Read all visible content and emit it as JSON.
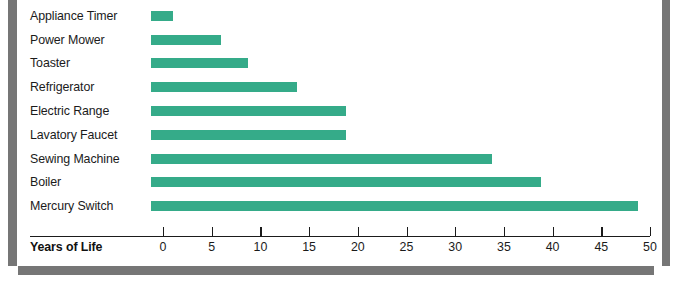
{
  "chart_data": {
    "type": "bar",
    "orientation": "horizontal",
    "title": "",
    "xlabel": "Years of Life",
    "ylabel": "",
    "xlim": [
      0,
      50
    ],
    "grid": false,
    "legend": null,
    "bar_color": "#35ab89",
    "xticks": [
      0,
      5,
      10,
      15,
      20,
      25,
      30,
      35,
      40,
      45,
      50
    ],
    "xtick_labels": [
      "0",
      "5",
      "10",
      "15",
      "20",
      "25",
      "30",
      "35",
      "40",
      "45",
      "50"
    ],
    "categories": [
      "Appliance Timer",
      "Power Mower",
      "Toaster",
      "Refrigerator",
      "Electric Range",
      "Lavatory Faucet",
      "Sewing Machine",
      "Boiler",
      "Mercury Switch"
    ],
    "values": [
      2.3,
      7.2,
      10,
      15,
      20,
      20,
      35,
      40,
      50
    ]
  }
}
